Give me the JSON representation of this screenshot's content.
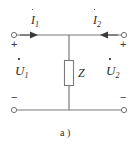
{
  "figure": {
    "caption": "a )",
    "background_color": "#ffffff",
    "line_color": "#7a7a7a",
    "text_color": "#2b2b2b"
  },
  "labels": {
    "current_left": {
      "symbol": "I",
      "subscript": "1",
      "has_dot_accent": true
    },
    "current_right": {
      "symbol": "I",
      "subscript": "2",
      "has_dot_accent": true
    },
    "voltage_left": {
      "symbol": "U",
      "subscript": "1",
      "has_dot_accent": true
    },
    "voltage_right": {
      "symbol": "U",
      "subscript": "2",
      "has_dot_accent": true
    },
    "impedance": {
      "symbol": "Z"
    }
  },
  "polarity": {
    "top_left": "+",
    "top_right": "+",
    "bottom_left": "−",
    "bottom_right": "−"
  },
  "terminals": {
    "top_left": "terminal-1",
    "top_right": "terminal-2",
    "bottom_left": "terminal-1-prime",
    "bottom_right": "terminal-2-prime"
  },
  "arrows": {
    "left_direction": "right",
    "right_direction": "left"
  }
}
